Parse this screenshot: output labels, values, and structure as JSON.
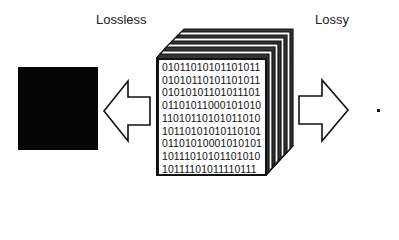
{
  "labels": {
    "lossless": "Lossless",
    "lossy": "Lossy"
  },
  "binary_rows": [
    "0101101010110101​1",
    "01010110101101011",
    "01010101101011101",
    "01101011000101010",
    "11010110101011010",
    "10110101010110101",
    "01101010001010101",
    "10111010101101010",
    "10111101011110111"
  ],
  "elements": {
    "lossless_result": "black-square-image",
    "lossy_result": "single-dot",
    "left_arrow": "arrow-left-icon",
    "right_arrow": "arrow-right-icon",
    "data_stack": "stacked-binary-pages"
  }
}
